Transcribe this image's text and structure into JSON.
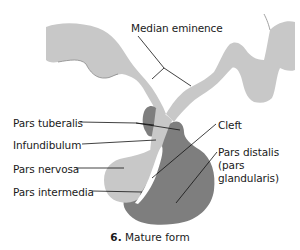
{
  "figure": {
    "caption_number": "6.",
    "caption_text": "Mature form",
    "colors": {
      "background": "#ffffff",
      "neural_tissue": "#c8c8c8",
      "glandular_tissue": "#7e7e7e",
      "cleft": "#ffffff",
      "leader_line": "#111111",
      "text": "#1a1a1a"
    }
  },
  "labels": {
    "median_eminence": "Median eminence",
    "pars_tuberalis": "Pars tuberalis",
    "infundibulum": "Infundibulum",
    "pars_nervosa": "Pars nervosa",
    "pars_intermedia": "Pars intermedia",
    "cleft": "Cleft",
    "pars_distalis_line1": "Pars distalis",
    "pars_distalis_line2": "(pars",
    "pars_distalis_line3": "glandularis)"
  }
}
